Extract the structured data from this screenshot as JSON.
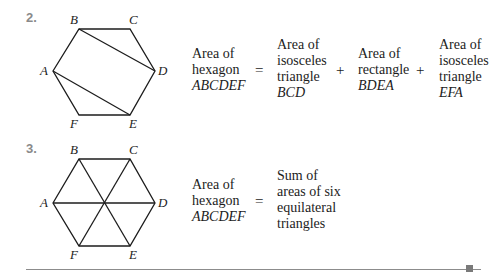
{
  "problems": [
    {
      "number": "2.",
      "vertices": {
        "A": "A",
        "B": "B",
        "C": "C",
        "D": "D",
        "E": "E",
        "F": "F"
      },
      "diagram": "hexagon ABCDEF with diagonals BD and AE",
      "equation": {
        "lhs": [
          "Area of",
          "hexagon",
          "ABCDEF"
        ],
        "equals": "=",
        "terms": [
          [
            "Area of",
            "isosceles",
            "triangle",
            "BCD"
          ],
          [
            "Area of",
            "rectangle",
            "BDEA"
          ],
          [
            "Area of",
            "isosceles",
            "triangle",
            "EFA"
          ]
        ],
        "plus": "+"
      }
    },
    {
      "number": "3.",
      "vertices": {
        "A": "A",
        "B": "B",
        "C": "C",
        "D": "D",
        "E": "E",
        "F": "F"
      },
      "diagram": "hexagon ABCDEF with diagonals AD, BE, CF through center",
      "equation": {
        "lhs": [
          "Area of",
          "hexagon",
          "ABCDEF"
        ],
        "equals": "=",
        "rhs": [
          "Sum of",
          "areas of six",
          "equilateral",
          "triangles"
        ]
      }
    }
  ]
}
